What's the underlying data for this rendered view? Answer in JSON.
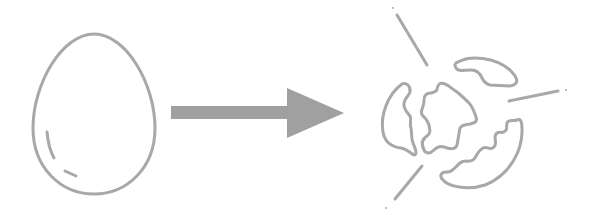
{
  "diagram": {
    "description": "Whole egg transforms into broken egg shell pieces",
    "colors": {
      "stroke": "#a8a8a8",
      "arrow": "#a0a0a0",
      "background": "#ffffff"
    },
    "nodes": [
      {
        "id": "egg",
        "label": "whole-egg-icon"
      },
      {
        "id": "arrow",
        "label": "right-arrow-icon"
      },
      {
        "id": "broken",
        "label": "broken-egg-icon"
      }
    ]
  }
}
